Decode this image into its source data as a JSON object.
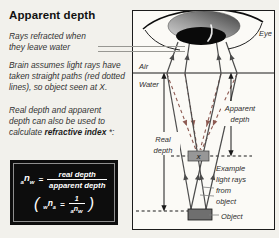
{
  "title": "Apparent depth",
  "notes": {
    "para1": [
      "Rays refracted when",
      "they leave water"
    ],
    "para2": [
      "Brain assumes light rays have",
      "taken straight paths (red dotted",
      "lines), so object seen at X."
    ],
    "para3": [
      "Real depth and apparent",
      "depth can also be used to"
    ],
    "para3_last": {
      "pre": "calculate ",
      "bold": "refractive index",
      "post": " *:"
    }
  },
  "formula": {
    "main": {
      "sub_left": "a",
      "base": "n",
      "sub_right": "w",
      "equals": "=",
      "numerator": "real depth",
      "denominator": "apparent depth"
    },
    "inverse": {
      "open_paren": "(",
      "sub_left": "w",
      "base": "n",
      "sub_right": "a",
      "equals": "=",
      "numerator": "1",
      "den_sub_left": "a",
      "den_base": "n",
      "den_sub_right": "w",
      "close_paren": ")"
    }
  },
  "diagram": {
    "eye_label": "Eye",
    "air_label": "Air",
    "water_label": "Water",
    "real_depth_label": [
      "Real",
      "depth"
    ],
    "apparent_depth_label": [
      "Apparent",
      "depth"
    ],
    "example_rays_label": [
      "Example",
      "light rays",
      "from",
      "object"
    ],
    "object_label": "Object",
    "x_marker": "X"
  },
  "colors": {
    "page_bg": "#f2f1ec",
    "panel_bg": "#fbfaf6",
    "solid_ray": "#4b4b4b",
    "red_dashed_ray": "#8d5a52",
    "formula_bg": "#0d0d0d",
    "formula_text": "#ffffff"
  }
}
